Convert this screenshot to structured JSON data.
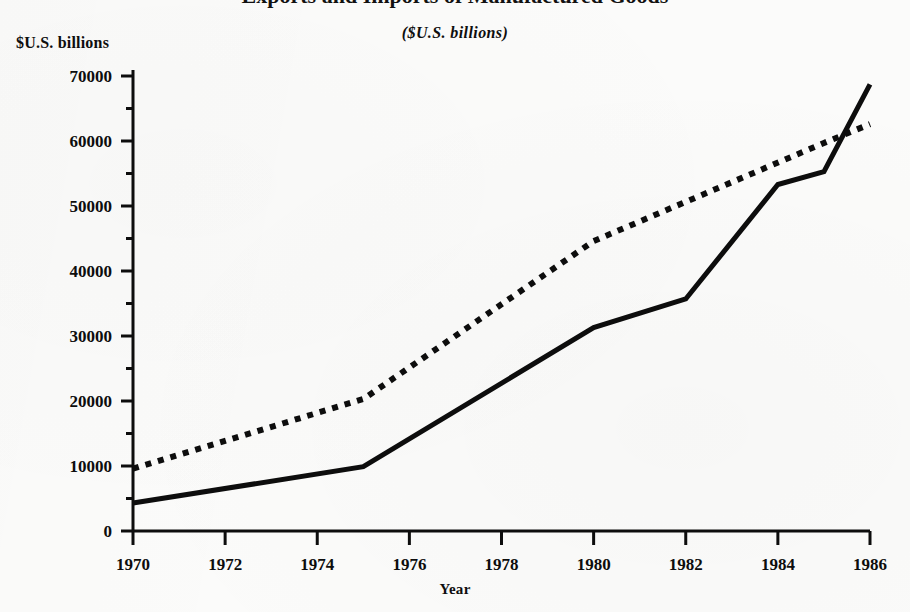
{
  "header": {
    "clipped_title": "Exports and Imports of Manufactured Goods",
    "subtitle": "($U.S. billions)",
    "y_axis_caption": "$U.S. billions"
  },
  "chart_data": {
    "type": "line",
    "title": "Exports and Imports of Manufactured Goods",
    "subtitle": "($U.S. billions)",
    "xlabel": "Year",
    "ylabel": "$U.S. billions",
    "xlim": [
      1970,
      1986
    ],
    "ylim": [
      0,
      70000
    ],
    "x_ticks": [
      1970,
      1972,
      1974,
      1976,
      1978,
      1980,
      1982,
      1984,
      1986
    ],
    "x_tick_labels": [
      "1970",
      "1972",
      "1974",
      "1976",
      "1978",
      "1980",
      "1982",
      "1984",
      "1986"
    ],
    "y_ticks": [
      0,
      10000,
      20000,
      30000,
      40000,
      50000,
      60000,
      70000
    ],
    "y_tick_labels": [
      "0",
      "10000",
      "20000",
      "30000",
      "40000",
      "50000",
      "60000",
      "70000"
    ],
    "y_minor_ticks": [
      5000,
      15000,
      25000,
      35000,
      45000,
      55000,
      65000
    ],
    "grid": false,
    "legend": false,
    "series": [
      {
        "name": "solid-series",
        "style": "solid",
        "color": "#0d0d0d",
        "x": [
          1970,
          1975,
          1980,
          1982,
          1984,
          1985,
          1986
        ],
        "values": [
          4300,
          9900,
          31300,
          35700,
          53300,
          55300,
          68700
        ]
      },
      {
        "name": "dotted-series",
        "style": "dotted",
        "color": "#0d0d0d",
        "x": [
          1970,
          1975,
          1980,
          1985,
          1986
        ],
        "values": [
          9600,
          20300,
          44600,
          59700,
          62600
        ]
      }
    ]
  }
}
